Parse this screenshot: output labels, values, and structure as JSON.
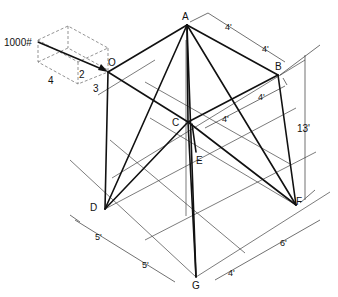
{
  "figure": {
    "type": "isometric space-truss diagram",
    "load": {
      "label": "1000#",
      "components": {
        "x": "4",
        "y": "2",
        "z": "3"
      }
    },
    "joints": [
      {
        "id": "A",
        "label": "A"
      },
      {
        "id": "B",
        "label": "B"
      },
      {
        "id": "C",
        "label": "C"
      },
      {
        "id": "O",
        "label": "O"
      },
      {
        "id": "E",
        "label": "E"
      },
      {
        "id": "D",
        "label": "D"
      },
      {
        "id": "F",
        "label": "F"
      },
      {
        "id": "G",
        "label": "G"
      }
    ],
    "members": [
      [
        "A",
        "O"
      ],
      [
        "A",
        "B"
      ],
      [
        "A",
        "C"
      ],
      [
        "A",
        "D"
      ],
      [
        "A",
        "F"
      ],
      [
        "A",
        "G"
      ],
      [
        "B",
        "C"
      ],
      [
        "B",
        "F"
      ],
      [
        "O",
        "C"
      ],
      [
        "O",
        "D"
      ],
      [
        "C",
        "D"
      ],
      [
        "C",
        "F"
      ],
      [
        "C",
        "G"
      ]
    ],
    "dimensions": {
      "top_ab_1": "4'",
      "top_ab_2": "4'",
      "bc_1": "4'",
      "bc_2": "4'",
      "height": "13'",
      "bottom_dg_1": "5'",
      "bottom_dg_2": "5'",
      "bottom_gf_1": "4'",
      "bottom_gf_2": "6'"
    }
  }
}
